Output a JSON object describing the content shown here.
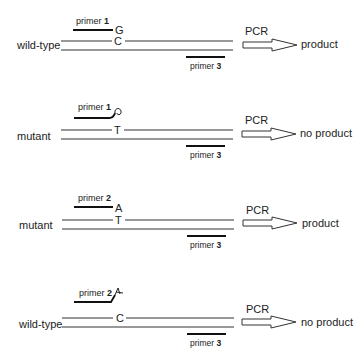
{
  "diagram": {
    "type": "allele-specific PCR schematic",
    "colors": {
      "line": "#333333",
      "text": "#222222",
      "background": "#ffffff"
    },
    "panels": [
      {
        "sample": "wild-type",
        "primer_label_prefix": "primer ",
        "primer_number": "1",
        "primer_end_base": "G",
        "primer_end": "match",
        "template_base": "C",
        "reverse_primer_prefix": "primer ",
        "reverse_primer_number": "3",
        "pcr_label": "PCR",
        "result": "product"
      },
      {
        "sample": "mutant",
        "primer_label_prefix": "primer ",
        "primer_number": "1",
        "primer_end_base": "",
        "primer_end": "mismatch-curl",
        "template_base": "T",
        "reverse_primer_prefix": "primer ",
        "reverse_primer_number": "3",
        "pcr_label": "PCR",
        "result": "no product"
      },
      {
        "sample": "mutant",
        "primer_label_prefix": "primer ",
        "primer_number": "2",
        "primer_end_base": "A",
        "primer_end": "match",
        "template_base": "T",
        "reverse_primer_prefix": "primer ",
        "reverse_primer_number": "3",
        "pcr_label": "PCR",
        "result": "product"
      },
      {
        "sample": "wild-type",
        "primer_label_prefix": "primer ",
        "primer_number": "2",
        "primer_end_base": "",
        "primer_end": "mismatch-kink",
        "template_base": "C",
        "reverse_primer_prefix": "primer ",
        "reverse_primer_number": "3",
        "pcr_label": "PCR",
        "result": "no product"
      }
    ]
  }
}
